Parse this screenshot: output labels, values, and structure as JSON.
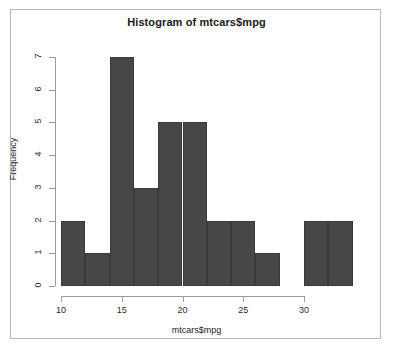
{
  "chart_data": {
    "type": "bar",
    "title": "Histogram of mtcars$mpg",
    "xlabel": "mtcars$mpg",
    "ylabel": "Frequency",
    "bin_width": 2,
    "bin_edges": [
      10,
      12,
      14,
      16,
      18,
      20,
      22,
      24,
      26,
      28,
      30,
      32,
      34
    ],
    "categories": [
      "10-12",
      "12-14",
      "14-16",
      "16-18",
      "18-20",
      "20-22",
      "22-24",
      "24-26",
      "26-28",
      "28-30",
      "30-32",
      "32-34"
    ],
    "values": [
      2,
      1,
      7,
      3,
      5,
      5,
      2,
      2,
      1,
      0,
      2,
      2
    ],
    "xlim": [
      10,
      34
    ],
    "ylim": [
      0,
      7
    ],
    "xticks": [
      10,
      15,
      20,
      25,
      30
    ],
    "xtick_labels": [
      "10",
      "15",
      "20",
      "25",
      "30"
    ],
    "yticks": [
      0,
      1,
      2,
      3,
      4,
      5,
      6,
      7
    ],
    "ytick_labels": [
      "0",
      "1",
      "2",
      "3",
      "4",
      "5",
      "6",
      "7"
    ],
    "grid": false,
    "legend": false,
    "bar_color": "#474747",
    "bar_border_color": "#3a3a3a",
    "axis_color": "#9b9b9b",
    "background_color": "#ffffff",
    "frame_border_color": "#b9b9b9"
  }
}
